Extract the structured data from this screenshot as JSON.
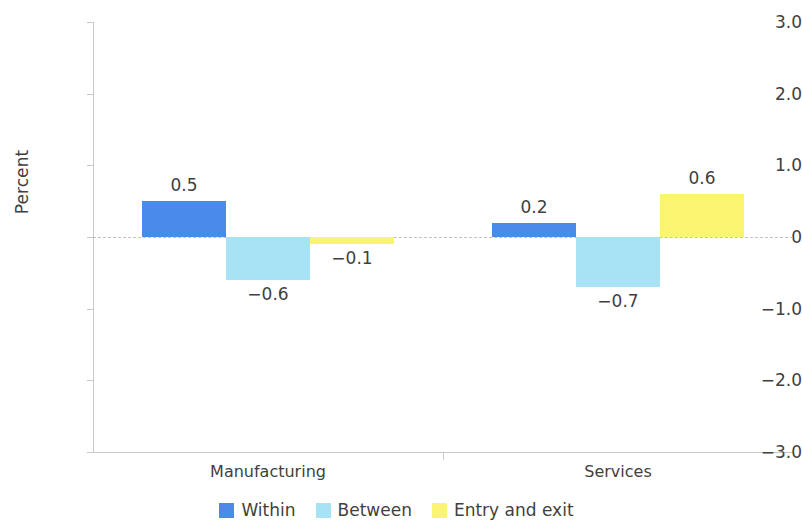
{
  "chart_data": {
    "type": "bar",
    "title": "",
    "subtitle": "",
    "xlabel": "",
    "ylabel": "Percent",
    "categories": [
      "Manufacturing",
      "Services"
    ],
    "series": [
      {
        "name": "Within",
        "color": "#4a8ae8",
        "values": [
          0.5,
          0.2
        ],
        "labels": [
          "0.5",
          "0.2"
        ]
      },
      {
        "name": "Between",
        "color": "#a8e2f5",
        "values": [
          -0.6,
          -0.7
        ],
        "labels": [
          "−0.6",
          "−0.7"
        ]
      },
      {
        "name": "Entry and exit",
        "color": "#faf571",
        "values": [
          -0.1,
          0.6
        ],
        "labels": [
          "−0.1",
          "0.6"
        ]
      }
    ],
    "ylim": [
      -3.0,
      3.0
    ],
    "yticks": [
      3.0,
      2.0,
      1.0,
      0,
      -1.0,
      -2.0,
      -3.0
    ],
    "ytick_labels": [
      "3.0",
      "2.0",
      "1.0",
      "0",
      "−1.0",
      "−2.0",
      "−3.0"
    ],
    "grid": false,
    "zero_line": true,
    "legend_position": "bottom",
    "bar_labels_shown": true
  },
  "colors": {
    "within": "#4a8ae8",
    "between": "#a8e2f5",
    "entry_and_exit": "#faf571",
    "axis": "#c9c9c9",
    "text": "#3f3f3f",
    "zero_line": "#c2c2c2",
    "background": "#ffffff"
  }
}
